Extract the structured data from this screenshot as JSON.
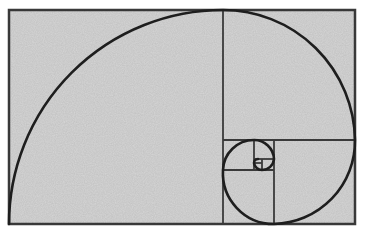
{
  "diagram": {
    "title": "Golden spiral in Fibonacci rectangle",
    "colors": {
      "background": "#ffffff",
      "fill": "#d6d6d6",
      "line": "#3a3a3a",
      "spiral": "#1e1e1e"
    },
    "frame": {
      "x": 9,
      "y": 10,
      "width": 346,
      "height": 214
    },
    "divisions": [
      {
        "type": "vertical",
        "x": 223,
        "y1": 10,
        "y2": 224
      },
      {
        "type": "horizontal",
        "y": 140,
        "x1": 223,
        "x2": 355
      },
      {
        "type": "vertical",
        "x": 274,
        "y1": 140,
        "y2": 224
      },
      {
        "type": "horizontal",
        "y": 170,
        "x1": 223,
        "x2": 274
      },
      {
        "type": "vertical",
        "x": 254,
        "y1": 140,
        "y2": 170
      },
      {
        "type": "horizontal",
        "y": 159,
        "x1": 254,
        "x2": 274
      },
      {
        "type": "vertical",
        "x": 262,
        "y1": 159,
        "y2": 170
      },
      {
        "type": "horizontal",
        "y": 163,
        "x1": 254,
        "x2": 262
      }
    ]
  }
}
